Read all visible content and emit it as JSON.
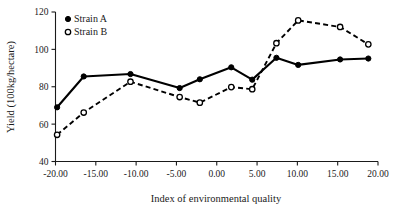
{
  "chart_data": {
    "type": "line",
    "title": "",
    "xlabel": "Index of environmental quality",
    "ylabel": "Yield (100kg/hectare)",
    "xlim": [
      -20,
      20
    ],
    "ylim": [
      40,
      120
    ],
    "xticks": [
      "-20.00",
      "-15.00",
      "-10.00",
      "-5.00",
      "0.00",
      "5.00",
      "10.00",
      "15.00",
      "20.00"
    ],
    "xtick_values": [
      -20,
      -15,
      -10,
      -5,
      0,
      5,
      10,
      15,
      20
    ],
    "yticks": [
      "40",
      "60",
      "80",
      "100",
      "120"
    ],
    "ytick_values": [
      40,
      60,
      80,
      100,
      120
    ],
    "grid": false,
    "legend_position": "top-left",
    "series": [
      {
        "name": "Strain A",
        "marker": "filled-circle",
        "line_style": "solid",
        "color": "#000000",
        "x": [
          -19.8,
          -16.5,
          -10.7,
          -4.6,
          -2.1,
          1.8,
          4.4,
          7.4,
          10.1,
          15.3,
          18.8
        ],
        "values": [
          69,
          85.5,
          86.8,
          79.3,
          84,
          90.4,
          83.8,
          95.5,
          91.7,
          94.6,
          95.1
        ]
      },
      {
        "name": "Strain B",
        "marker": "open-circle",
        "line_style": "dashed",
        "color": "#000000",
        "x": [
          -19.8,
          -16.5,
          -10.7,
          -4.6,
          -2.1,
          1.8,
          4.4,
          7.4,
          10.1,
          15.3,
          18.8
        ],
        "values": [
          54.3,
          66.2,
          82.7,
          74.5,
          71.5,
          79.8,
          78.7,
          103.3,
          115.5,
          112,
          102.7
        ]
      }
    ]
  },
  "legend": {
    "items": [
      {
        "label": "Strain A",
        "marker": "filled-circle"
      },
      {
        "label": "Strain B",
        "marker": "open-circle"
      }
    ]
  },
  "axes": {
    "x_label": "Index of environmental quality",
    "y_label": "Yield (100kg/hectare)"
  }
}
